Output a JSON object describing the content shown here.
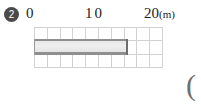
{
  "question": {
    "number_marker": "2"
  },
  "axis": {
    "labels": [
      {
        "text": "0",
        "value": 0
      },
      {
        "text": "10",
        "value": 10
      },
      {
        "text": "20",
        "value": 20
      }
    ],
    "unit": "(m)",
    "unit_full": "m"
  },
  "grid": {
    "columns": 10,
    "rows": 3,
    "column_value": 2,
    "line_color": "#d2d2d2"
  },
  "bar": {
    "start_value": 0,
    "end_value": 14.5,
    "fill_color": "#e8e8e8",
    "border_color": "#8f8f8f"
  },
  "answer_field": {
    "open_paren": "("
  },
  "chart_data": {
    "type": "bar",
    "title": "",
    "xlabel": "(m)",
    "ylabel": "",
    "categories": [
      "length"
    ],
    "values": [
      14.5
    ],
    "xlim": [
      0,
      20
    ],
    "x_ticks": [
      0,
      10,
      20
    ],
    "grid": true,
    "legend": "none",
    "orientation": "horizontal",
    "grid_columns": 10,
    "grid_rows": 3,
    "units_per_column": 2
  }
}
